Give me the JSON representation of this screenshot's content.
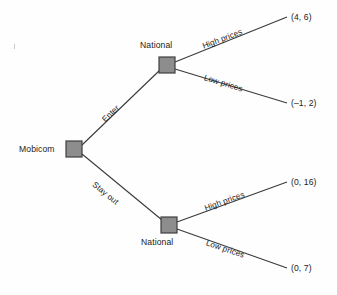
{
  "diagram": {
    "type": "extensive-form-game-tree",
    "title": "",
    "background_color": "#fefefe",
    "node_fill_color": "#8d8d8d",
    "node_stroke_color": "#3f3f3f",
    "line_color": "#3a3a3a",
    "text_color": "#1c1c1c"
  },
  "nodes": {
    "root": {
      "player": "Mobicom",
      "x": 74,
      "y": 149
    },
    "upper_decision": {
      "player": "National",
      "x": 167,
      "y": 65
    },
    "lower_decision": {
      "player": "National",
      "x": 169,
      "y": 225
    }
  },
  "edges": {
    "root_up": {
      "label": "Enter"
    },
    "root_down": {
      "label": "Stay out"
    },
    "upper_high": {
      "label": "High prices"
    },
    "upper_low": {
      "label": "Low prices"
    },
    "lower_high": {
      "label": "High prices"
    },
    "lower_low": {
      "label": "Low prices"
    }
  },
  "payoffs": {
    "enter_high": "(4, 6)",
    "enter_low": "(–1, 2)",
    "stayout_high": "(0, 16)",
    "stayout_low": "(0, 7)"
  }
}
